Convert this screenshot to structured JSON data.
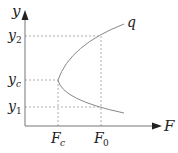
{
  "diagram": {
    "axes": {
      "x_label": "F",
      "y_label": "y"
    },
    "y_ticks": [
      {
        "label": "y",
        "sub": "2"
      },
      {
        "label": "y",
        "sub": "c"
      },
      {
        "label": "y",
        "sub": "1"
      }
    ],
    "x_ticks": [
      {
        "label": "F",
        "sub": "c"
      },
      {
        "label": "F",
        "sub": "0"
      }
    ],
    "curve_label": "q",
    "colors": {
      "axis": "#777777",
      "curve": "#888888",
      "dashed": "#999999",
      "text": "#222222"
    }
  }
}
